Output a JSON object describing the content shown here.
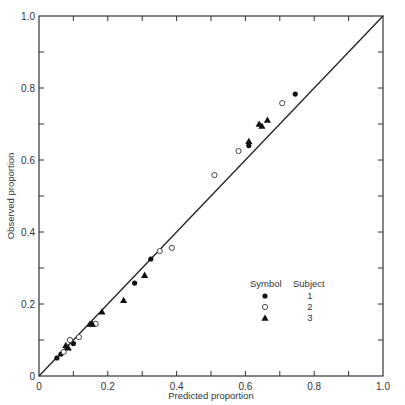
{
  "chart_data": {
    "type": "scatter",
    "title": "",
    "xlabel": "Predicted proportion",
    "ylabel": "Observed proportion",
    "xlim": [
      0,
      1.0
    ],
    "ylim": [
      0,
      1.0
    ],
    "grid": false,
    "x_ticks": [
      "0",
      "0.2",
      "0.4",
      "0.6",
      "0.8",
      "1.0"
    ],
    "y_ticks": [
      "0",
      "0.2",
      "0.4",
      "0.6",
      "0.8",
      "1.0"
    ],
    "reference_line": {
      "type": "identity",
      "from": [
        0,
        0
      ],
      "to": [
        1,
        1
      ]
    },
    "legend": {
      "position": "lower right",
      "header_symbol": "Symbol",
      "header_subject": "Subject",
      "entries": [
        {
          "marker": "filled-circle",
          "label": "1"
        },
        {
          "marker": "open-circle",
          "label": "2"
        },
        {
          "marker": "filled-triangle",
          "label": "3"
        }
      ]
    },
    "series": [
      {
        "name": "1",
        "marker": "filled-circle",
        "points": [
          [
            0.052,
            0.05
          ],
          [
            0.064,
            0.061
          ],
          [
            0.1,
            0.09
          ],
          [
            0.278,
            0.258
          ],
          [
            0.325,
            0.325
          ],
          [
            0.61,
            0.64
          ],
          [
            0.745,
            0.783
          ]
        ]
      },
      {
        "name": "2",
        "marker": "open-circle",
        "points": [
          [
            0.072,
            0.067
          ],
          [
            0.09,
            0.1
          ],
          [
            0.116,
            0.108
          ],
          [
            0.165,
            0.145
          ],
          [
            0.351,
            0.347
          ],
          [
            0.386,
            0.356
          ],
          [
            0.51,
            0.558
          ],
          [
            0.58,
            0.625
          ],
          [
            0.707,
            0.758
          ]
        ]
      },
      {
        "name": "3",
        "marker": "filled-triangle",
        "points": [
          [
            0.078,
            0.085
          ],
          [
            0.085,
            0.078
          ],
          [
            0.148,
            0.144
          ],
          [
            0.155,
            0.144
          ],
          [
            0.183,
            0.178
          ],
          [
            0.246,
            0.21
          ],
          [
            0.307,
            0.28
          ],
          [
            0.61,
            0.652
          ],
          [
            0.64,
            0.7
          ],
          [
            0.648,
            0.694
          ],
          [
            0.664,
            0.711
          ]
        ]
      }
    ]
  }
}
